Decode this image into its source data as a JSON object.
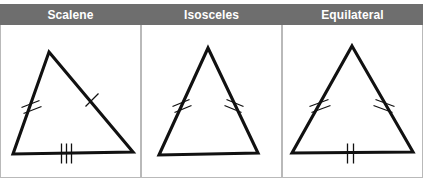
{
  "figure": {
    "type": "diagram",
    "panel_count": 3
  },
  "colors": {
    "header_bg": "#6e6e6e",
    "header_text": "#ffffff",
    "panel_bg": "#ffffff",
    "panel_border": "#b9b9b9",
    "stroke": "#111111"
  },
  "panels": [
    {
      "id": "scalene",
      "title": "Scalene",
      "x": 0,
      "width": 141,
      "triangle": {
        "apex": {
          "x": 48,
          "y": 52
        },
        "left": {
          "x": 12,
          "y": 154
        },
        "right": {
          "x": 132,
          "y": 152
        },
        "tick_marks": {
          "left_side": 2,
          "right_side": 1,
          "base": 3
        }
      }
    },
    {
      "id": "isosceles",
      "title": "Isosceles",
      "x": 141,
      "width": 141,
      "triangle": {
        "apex": {
          "x": 207,
          "y": 48
        },
        "left": {
          "x": 158,
          "y": 155
        },
        "right": {
          "x": 257,
          "y": 153
        },
        "tick_marks": {
          "left_side": 2,
          "right_side": 2,
          "base": 0
        }
      }
    },
    {
      "id": "equilateral",
      "title": "Equilateral",
      "x": 282,
      "width": 141,
      "triangle": {
        "apex": {
          "x": 351,
          "y": 46
        },
        "left": {
          "x": 291,
          "y": 153
        },
        "right": {
          "x": 412,
          "y": 152
        },
        "tick_marks": {
          "left_side": 2,
          "right_side": 2,
          "base": 2
        }
      }
    }
  ]
}
